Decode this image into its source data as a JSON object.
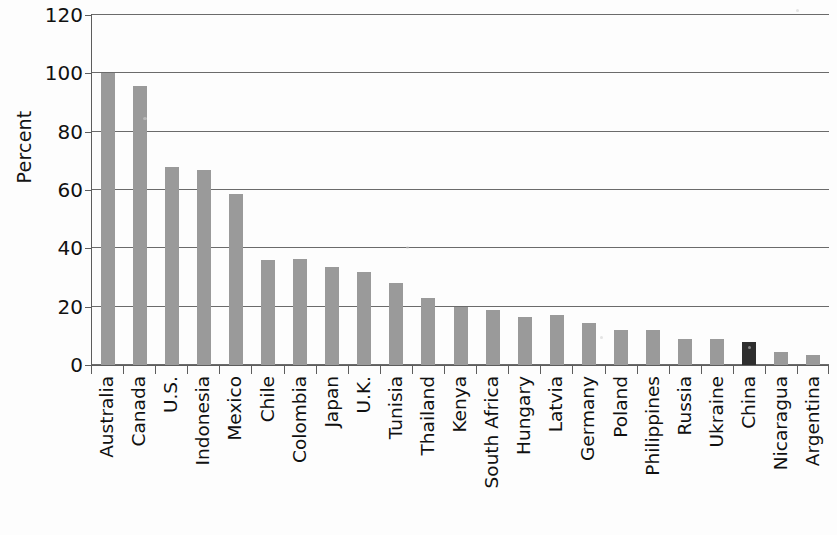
{
  "chart_data": {
    "type": "bar",
    "title": "",
    "xlabel": "",
    "ylabel": "Percent",
    "ylim": [
      0,
      120
    ],
    "yticks": [
      0,
      20,
      40,
      60,
      80,
      100,
      120
    ],
    "grid": true,
    "legend": "none",
    "bar_color": "#9a9a9a",
    "highlight_color": "#2e2e2e",
    "highlight_category": "China",
    "categories": [
      "Australia",
      "Canada",
      "U.S.",
      "Indonesia",
      "Mexico",
      "Chile",
      "Colombia",
      "Japan",
      "U.K.",
      "Tunisia",
      "Thailand",
      "Kenya",
      "South Africa",
      "Hungary",
      "Latvia",
      "Germany",
      "Poland",
      "Philippines",
      "Russia",
      "Ukraine",
      "China",
      "Nicaragua",
      "Argentina"
    ],
    "values": [
      100,
      95.5,
      68,
      67,
      58.5,
      36,
      36.5,
      33.5,
      32,
      28,
      23,
      20,
      19,
      16.5,
      17,
      14.5,
      12,
      12,
      9,
      8.8,
      8,
      4.5,
      3.5
    ]
  },
  "axis": {
    "y_title": "Percent",
    "y_tick_labels": [
      "120",
      "100",
      "80",
      "60",
      "40",
      "20",
      "0"
    ]
  }
}
